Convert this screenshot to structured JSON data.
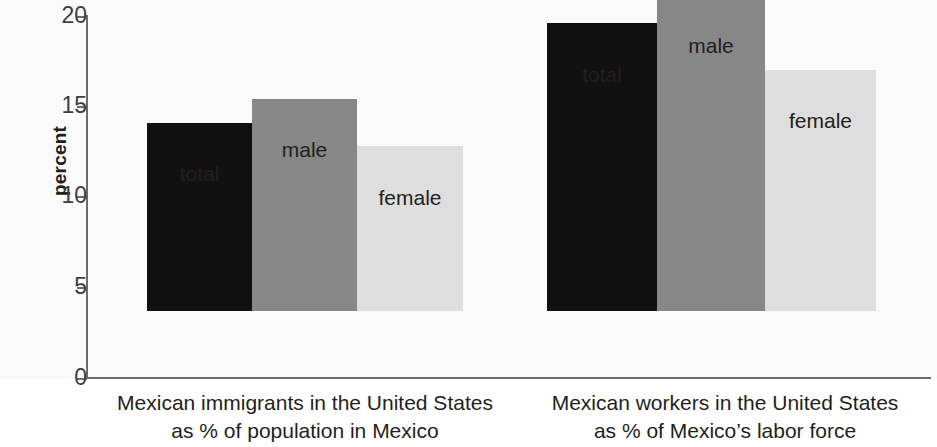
{
  "chart_data": {
    "type": "bar",
    "title": "",
    "xlabel": "",
    "ylabel": "percent",
    "ylim": [
      0,
      20
    ],
    "yticks": [
      "0",
      "5",
      "10",
      "15",
      "20"
    ],
    "ytick_values": [
      0,
      5,
      10,
      15,
      20
    ],
    "grid": false,
    "legend": "none (bars labeled directly)",
    "categories": [
      "Mexican immigrants in the United States as % of population in Mexico",
      "Mexican workers in the United States as % of Mexico's labor force"
    ],
    "series": [
      {
        "name": "total",
        "values": [
          10.4,
          15.9
        ],
        "color": "#111111"
      },
      {
        "name": "male",
        "values": [
          11.7,
          17.3
        ],
        "color": "#8a8a8a"
      },
      {
        "name": "female",
        "values": [
          9.1,
          13.3
        ],
        "color": "#e2e2e2"
      }
    ]
  },
  "axis": {
    "y_title": "percent",
    "ticks": [
      {
        "label": "20",
        "value": 20
      },
      {
        "label": "15",
        "value": 15
      },
      {
        "label": "10",
        "value": 10
      },
      {
        "label": "5",
        "value": 5
      },
      {
        "label": "0",
        "value": 0
      }
    ]
  },
  "groups": [
    {
      "caption_line1": "Mexican immigrants in the United States",
      "caption_line2": "as % of population in Mexico",
      "bars": [
        {
          "label": "total",
          "value": 10.4
        },
        {
          "label": "male",
          "value": 11.7
        },
        {
          "label": "female",
          "value": 9.1
        }
      ]
    },
    {
      "caption_line1": "Mexican workers in the United States",
      "caption_line2": "as % of Mexico’s labor force",
      "bars": [
        {
          "label": "total",
          "value": 15.9
        },
        {
          "label": "male",
          "value": 17.3
        },
        {
          "label": "female",
          "value": 13.3
        }
      ]
    }
  ],
  "colors": {
    "total": "#111111",
    "male": "#8a8a8a",
    "female": "#e2e2e2",
    "axis": "#6d6e71",
    "text": "#231f20",
    "background": "#ffffff"
  }
}
